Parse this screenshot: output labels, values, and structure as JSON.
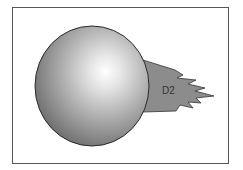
{
  "diagram": {
    "label": "D2",
    "colors": {
      "frame_border": "#555555",
      "sphere_highlight": "#ffffff",
      "sphere_mid": "#b8b8b8",
      "sphere_shadow": "#6a6a6a",
      "sphere_outline": "#2a2a2a",
      "flare_fill": "#8c8c8c",
      "flare_outline": "#333333",
      "label_color": "#333333"
    }
  }
}
